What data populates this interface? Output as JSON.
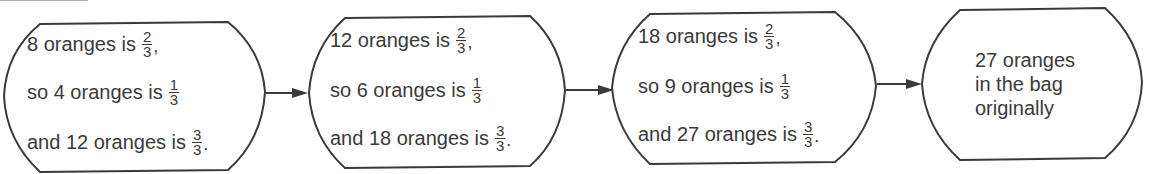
{
  "diagram": {
    "type": "flowchart",
    "direction": "left-to-right",
    "stroke_color": "#3a3a3a",
    "text_color": "#3a3a3a",
    "boxes": [
      {
        "lines": [
          {
            "text": "8 oranges is",
            "num": "2",
            "den": "3",
            "punct": ","
          },
          {
            "text": "so 4 oranges is",
            "num": "1",
            "den": "3",
            "punct": ""
          },
          {
            "text": "and 12 oranges is",
            "num": "3",
            "den": "3",
            "punct": "."
          }
        ]
      },
      {
        "lines": [
          {
            "text": "12 oranges is",
            "num": "2",
            "den": "3",
            "punct": ","
          },
          {
            "text": "so 6 oranges is",
            "num": "1",
            "den": "3",
            "punct": ""
          },
          {
            "text": "and 18 oranges is",
            "num": "3",
            "den": "3",
            "punct": "."
          }
        ]
      },
      {
        "lines": [
          {
            "text": "18 oranges is",
            "num": "2",
            "den": "3",
            "punct": ","
          },
          {
            "text": "so 9 oranges is",
            "num": "1",
            "den": "3",
            "punct": ""
          },
          {
            "text": "and 27 oranges is",
            "num": "3",
            "den": "3",
            "punct": "."
          }
        ]
      },
      {
        "final_lines": [
          "27 oranges",
          "in the bag",
          "originally"
        ]
      }
    ]
  }
}
